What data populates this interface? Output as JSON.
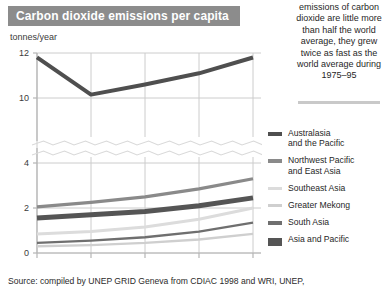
{
  "title": "Carbon dioxide emissions per capita",
  "unit_label": "tonnes/year",
  "side_note": "emissions of carbon dioxide are little more than half the world average, they grew twice as fast as the world average during 1975–95",
  "footer": "Source: compiled by UNEP GRID Geneva from CDIAC 1998 and WRI, UNEP,",
  "legend": {
    "items": [
      {
        "label": "Australasia\nand the Pacific",
        "color": "#4f4f4f",
        "thickness": 4
      },
      {
        "label": "Northwest Pacific\nand  East Asia",
        "color": "#8a8a8a",
        "thickness": 4
      },
      {
        "label": "Southeast Asia",
        "color": "#dcdcdc",
        "thickness": 3
      },
      {
        "label": "Greater Mekong",
        "color": "#cfcfcf",
        "thickness": 3
      },
      {
        "label": "South Asia",
        "color": "#6f6f6f",
        "thickness": 4
      },
      {
        "label": "Asia and Pacific",
        "color": "#555555",
        "thickness": 8
      }
    ]
  },
  "axes": {
    "y_ticks_upper": [
      "12",
      "10"
    ],
    "y_ticks_lower": [
      "4",
      "2",
      "0"
    ],
    "x_ticks": [
      "1975",
      "1980",
      "1985",
      "1990",
      "1995"
    ],
    "axis_break": true,
    "grid_color": "#cccccc",
    "axis_color": "#b5b5b5"
  },
  "chart_data": {
    "type": "line",
    "title": "Carbon dioxide emissions per capita",
    "xlabel": "",
    "ylabel": "tonnes/year",
    "x": [
      1975,
      1980,
      1985,
      1990,
      1995
    ],
    "xlim": [
      1975,
      1995
    ],
    "ylim_lower": [
      0,
      4
    ],
    "ylim_upper": [
      9.5,
      12
    ],
    "axis_break_note": "y-axis is broken between 4 and 9.5; upper band shows 10 and 12",
    "grid": true,
    "legend_position": "right",
    "series": [
      {
        "name": "Australasia and the Pacific",
        "color": "#4f4f4f",
        "thickness": 4,
        "values": [
          8.7,
          10.15,
          10.6,
          11.1,
          11.8
        ]
      },
      {
        "name": "Northwest Pacific and East Asia",
        "color": "#8a8a8a",
        "thickness": 3.2,
        "values": [
          2.05,
          2.25,
          2.5,
          2.85,
          3.3
        ]
      },
      {
        "name": "Asia and Pacific",
        "color": "#555555",
        "thickness": 5,
        "values": [
          1.55,
          1.7,
          1.85,
          2.1,
          2.45
        ]
      },
      {
        "name": "Southeast Asia",
        "color": "#dcdcdc",
        "thickness": 3,
        "values": [
          0.85,
          0.95,
          1.15,
          1.5,
          2.0
        ]
      },
      {
        "name": "South Asia",
        "color": "#6f6f6f",
        "thickness": 2.4,
        "values": [
          0.45,
          0.55,
          0.7,
          0.95,
          1.35
        ]
      },
      {
        "name": "Greater Mekong",
        "color": "#cfcfcf",
        "thickness": 2.4,
        "values": [
          0.3,
          0.35,
          0.45,
          0.6,
          0.85
        ]
      }
    ]
  }
}
